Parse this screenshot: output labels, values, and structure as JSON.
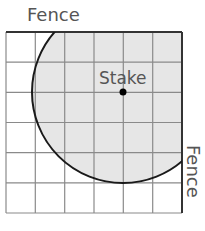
{
  "diagram": {
    "top_label": "Fence",
    "right_label": "Fence",
    "stake_label": "Stake",
    "grid": {
      "columns": 6,
      "rows": 6
    },
    "stake": {
      "col": 4,
      "row": 2
    },
    "radius_cells": 3,
    "colors": {
      "shade": "#e6e6e6",
      "grid_line": "#8a8a8a",
      "fence_line": "#333333",
      "arc": "#1a1a1a",
      "stake_dot": "#000000"
    }
  }
}
